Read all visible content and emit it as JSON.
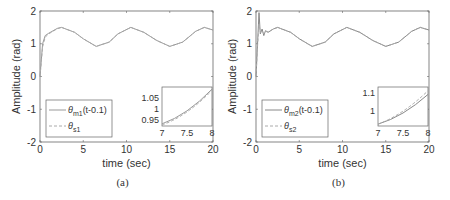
{
  "chart_data": [
    {
      "type": "line",
      "panel_label": "(a)",
      "xlabel": "time (sec)",
      "ylabel": "Amplitude (rad)",
      "xlim": [
        0,
        20
      ],
      "ylim": [
        -2,
        2
      ],
      "xticks": [
        "0",
        "5",
        "10",
        "15",
        "20"
      ],
      "yticks": [
        "-2",
        "-1",
        "0",
        "1",
        "2"
      ],
      "grid": false,
      "legend_position": "lower-left",
      "series": [
        {
          "name": "θm1(t-0.1)",
          "style": "solid",
          "color": "#999999",
          "x": [
            0,
            0.3,
            0.6,
            1,
            2,
            2.5,
            4,
            5,
            6.5,
            8,
            9,
            10.5,
            12,
            13.5,
            15,
            16.5,
            18,
            19,
            20
          ],
          "y": [
            0,
            1.0,
            1.25,
            1.32,
            1.47,
            1.5,
            1.35,
            1.15,
            0.92,
            1.05,
            1.3,
            1.5,
            1.35,
            1.1,
            0.92,
            1.05,
            1.38,
            1.5,
            1.42
          ]
        },
        {
          "name": "θs1",
          "style": "dashed",
          "color": "#aaaaaa",
          "x": [
            0,
            0.3,
            0.6,
            1,
            2,
            2.5,
            4,
            5,
            6.5,
            8,
            9,
            10.5,
            12,
            13.5,
            15,
            16.5,
            18,
            19,
            20
          ],
          "y": [
            0,
            0.9,
            1.2,
            1.3,
            1.46,
            1.5,
            1.35,
            1.15,
            0.92,
            1.05,
            1.3,
            1.5,
            1.35,
            1.1,
            0.92,
            1.05,
            1.38,
            1.5,
            1.42
          ]
        }
      ],
      "inset": {
        "xlim": [
          7,
          8
        ],
        "ylim": [
          0.92,
          1.1
        ],
        "xticks": [
          "7",
          "7.5",
          "8"
        ],
        "yticks": [
          "0.95",
          "1",
          "1.05"
        ],
        "series": [
          {
            "name": "θm1(t-0.1)",
            "x": [
              7,
              7.5,
              8
            ],
            "y": [
              0.93,
              0.99,
              1.09
            ]
          },
          {
            "name": "θs1",
            "x": [
              7,
              7.5,
              8
            ],
            "y": [
              0.925,
              0.985,
              1.085
            ]
          }
        ]
      }
    },
    {
      "type": "line",
      "panel_label": "(b)",
      "xlabel": "time (sec)",
      "ylabel": "Amplitude (rad)",
      "xlim": [
        0,
        20
      ],
      "ylim": [
        -2,
        2
      ],
      "xticks": [
        "0",
        "5",
        "10",
        "15",
        "20"
      ],
      "yticks": [
        "-2",
        "-1",
        "0",
        "1",
        "2"
      ],
      "grid": false,
      "legend_position": "lower-left",
      "series": [
        {
          "name": "θm2(t-0.1)",
          "style": "solid",
          "color": "#888888",
          "x": [
            0,
            0.2,
            0.35,
            0.5,
            0.7,
            0.9,
            1.1,
            1.4,
            2,
            2.5,
            4,
            5,
            6.5,
            8,
            9,
            10.5,
            12,
            13.5,
            15,
            16.5,
            18,
            19,
            20
          ],
          "y": [
            0,
            1.1,
            1.95,
            1.3,
            1.45,
            1.25,
            1.4,
            1.35,
            1.45,
            1.5,
            1.35,
            1.15,
            0.92,
            1.05,
            1.3,
            1.5,
            1.35,
            1.1,
            0.92,
            1.05,
            1.38,
            1.5,
            1.42
          ]
        },
        {
          "name": "θs2",
          "style": "dashed",
          "color": "#aaaaaa",
          "x": [
            0,
            0.2,
            0.35,
            0.5,
            0.7,
            0.9,
            1.1,
            1.4,
            2,
            2.5,
            4,
            5,
            6.5,
            8,
            9,
            10.5,
            12,
            13.5,
            15,
            16.5,
            18,
            19,
            20
          ],
          "y": [
            0,
            1.0,
            1.6,
            1.35,
            1.4,
            1.3,
            1.38,
            1.36,
            1.45,
            1.5,
            1.35,
            1.15,
            0.92,
            1.05,
            1.3,
            1.5,
            1.35,
            1.1,
            0.92,
            1.05,
            1.38,
            1.5,
            1.42
          ]
        }
      ],
      "inset": {
        "xlim": [
          7,
          8
        ],
        "ylim": [
          0.92,
          1.13
        ],
        "xticks": [
          "7",
          "7.5",
          "8"
        ],
        "yticks": [
          "1",
          "1.1"
        ],
        "series": [
          {
            "name": "θm2(t-0.1)",
            "x": [
              7,
              7.5,
              8
            ],
            "y": [
              0.93,
              0.99,
              1.09
            ]
          },
          {
            "name": "θs2",
            "x": [
              7,
              7.5,
              8
            ],
            "y": [
              0.93,
              1.0,
              1.11
            ]
          }
        ]
      }
    }
  ],
  "panels": [
    {
      "caption": "(a)",
      "xlabel": "time (sec)",
      "ylabel": "Amplitude (rad)",
      "legend": [
        {
          "sym": "θ",
          "sub": "m1",
          "suffix": "(t-0.1)"
        },
        {
          "sym": "θ",
          "sub": "s1",
          "suffix": ""
        }
      ]
    },
    {
      "caption": "(b)",
      "xlabel": "time (sec)",
      "ylabel": "Amplitude (rad)",
      "legend": [
        {
          "sym": "θ",
          "sub": "m2",
          "suffix": "(t-0.1)"
        },
        {
          "sym": "θ",
          "sub": "s2",
          "suffix": ""
        }
      ]
    }
  ]
}
